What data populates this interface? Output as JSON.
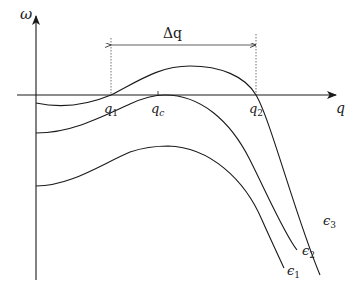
{
  "diagram": {
    "axes": {
      "y_label": "ω",
      "x_label": "q"
    },
    "points": {
      "q1": "q",
      "q1_sub": "1",
      "qc": "q",
      "qc_sub": "c",
      "q2": "q",
      "q2_sub": "2"
    },
    "interval": {
      "label": "Δq"
    },
    "curves": [
      {
        "id": "eps1",
        "label": "ϵ",
        "sub": "1"
      },
      {
        "id": "eps2",
        "label": "ϵ",
        "sub": "2"
      },
      {
        "id": "eps3",
        "label": "ϵ",
        "sub": "3"
      }
    ],
    "colors": {
      "ink": "#1a1a1a",
      "background": "#ffffff"
    }
  }
}
